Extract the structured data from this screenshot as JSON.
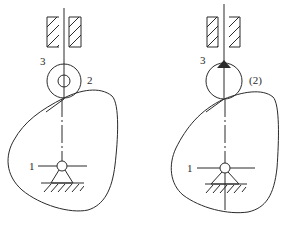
{
  "figures": [
    {
      "id": "left",
      "description": "Cam mechanism with roller follower",
      "labels": {
        "cam": "1",
        "roller": "2",
        "follower": "3"
      }
    },
    {
      "id": "right",
      "description": "Cam mechanism with enlarged roller follower",
      "labels": {
        "cam": "1",
        "roller": "(2)",
        "follower": "3"
      }
    }
  ],
  "colors": {
    "line": "#2a2a2a",
    "background": "#ffffff"
  }
}
